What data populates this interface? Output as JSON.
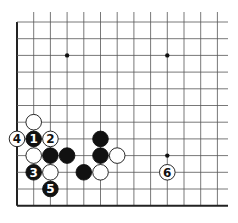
{
  "diagram": {
    "type": "go-board-fragment",
    "grid": {
      "origin_x": 17,
      "origin_y": 22,
      "spacing": 16.7,
      "columns": 13,
      "rows": 12,
      "line_extend_right": 228,
      "line_extend_top": 12,
      "left_edge": true,
      "bottom_edge": true,
      "line_color": "#555555",
      "edge_color": "#222222"
    },
    "hoshi": [
      {
        "col": 3,
        "row": 2
      },
      {
        "col": 9,
        "row": 2
      },
      {
        "col": 9,
        "row": 8
      }
    ],
    "stones": [
      {
        "col": 1,
        "row": 6,
        "color": "white",
        "label": ""
      },
      {
        "col": 0,
        "row": 7,
        "color": "white",
        "label": "4"
      },
      {
        "col": 1,
        "row": 7,
        "color": "black",
        "label": "1"
      },
      {
        "col": 2,
        "row": 7,
        "color": "white",
        "label": "2"
      },
      {
        "col": 1,
        "row": 8,
        "color": "white",
        "label": ""
      },
      {
        "col": 2,
        "row": 8,
        "color": "black",
        "label": ""
      },
      {
        "col": 3,
        "row": 8,
        "color": "black",
        "label": ""
      },
      {
        "col": 5,
        "row": 7,
        "color": "black",
        "label": ""
      },
      {
        "col": 5,
        "row": 8,
        "color": "black",
        "label": ""
      },
      {
        "col": 6,
        "row": 8,
        "color": "white",
        "label": ""
      },
      {
        "col": 1,
        "row": 9,
        "color": "black",
        "label": "3"
      },
      {
        "col": 2,
        "row": 9,
        "color": "white",
        "label": ""
      },
      {
        "col": 4,
        "row": 9,
        "color": "black",
        "label": ""
      },
      {
        "col": 5,
        "row": 9,
        "color": "white",
        "label": ""
      },
      {
        "col": 9,
        "row": 9,
        "color": "white",
        "label": "6"
      },
      {
        "col": 2,
        "row": 10,
        "color": "black",
        "label": "5"
      }
    ]
  }
}
